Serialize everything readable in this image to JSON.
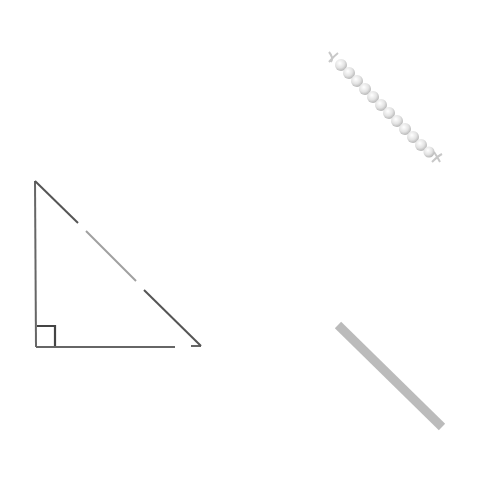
{
  "diagram": {
    "background": "#ffffff",
    "triangle": {
      "type": "right-triangle",
      "vertices": {
        "top": [
          35,
          181
        ],
        "bottom_left": [
          36,
          347
        ],
        "bottom_right": [
          201,
          347
        ]
      },
      "right_angle_marker": true,
      "stroke": "#555555",
      "hypotenuse_segments": [
        {
          "from": [
            35,
            181
          ],
          "to": [
            78,
            223
          ],
          "color": "#555555"
        },
        {
          "from": [
            86,
            231
          ],
          "to": [
            136,
            281
          ],
          "color": "#9a9a9a"
        },
        {
          "from": [
            144,
            290
          ],
          "to": [
            201,
            346
          ],
          "color": "#555555"
        }
      ]
    },
    "pearl_chain": {
      "from": [
        332,
        56
      ],
      "to": [
        436,
        158
      ],
      "bead_count": 13,
      "color": "#dcdcdc"
    },
    "bar": {
      "from": [
        338,
        325
      ],
      "to": [
        442,
        427
      ],
      "width": 9,
      "color": "#bbbbbb"
    }
  }
}
